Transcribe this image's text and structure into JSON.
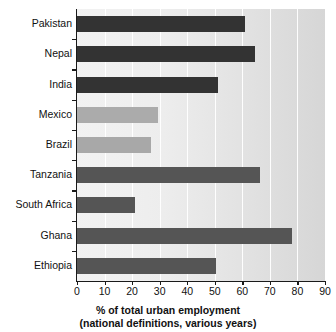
{
  "chart_data": {
    "type": "bar",
    "orientation": "horizontal",
    "title": "",
    "subtitle": "",
    "xlabel": "% of total urban employment (national definitions, various years)",
    "xlabel_line1": "% of total urban employment",
    "xlabel_line2": "(national definitions, various years)",
    "ylabel": "",
    "categories": [
      "Pakistan",
      "Nepal",
      "India",
      "Mexico",
      "Brazil",
      "Tanzania",
      "South Africa",
      "Ghana",
      "Ethiopia"
    ],
    "values": [
      61,
      64.5,
      51,
      29.5,
      27,
      66.5,
      21,
      78,
      50.5
    ],
    "bar_colors": [
      "#333333",
      "#333333",
      "#333333",
      "#ababab",
      "#a8a8a8",
      "#555555",
      "#555555",
      "#555555",
      "#555555"
    ],
    "xlim": [
      0,
      90
    ],
    "xticks": [
      0,
      10,
      20,
      30,
      40,
      50,
      60,
      70,
      80,
      90
    ],
    "xtick_labels": [
      "0",
      "10",
      "20",
      "30",
      "40",
      "50",
      "60",
      "70",
      "80",
      "90"
    ],
    "grid": true,
    "gridline_color": "#ffffff",
    "grid_axis": "x",
    "legend": false,
    "legend_position": "none",
    "plot_background": "#e9e9e9",
    "axis_color": "#1a1a1a",
    "text_color": "#111111"
  }
}
